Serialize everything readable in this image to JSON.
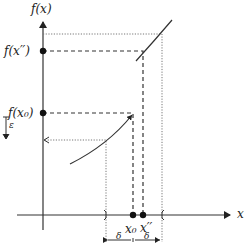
{
  "diagram": {
    "type": "epsilon-delta continuity illustration",
    "labels": {
      "y_axis": "f(x)",
      "x_axis": "x",
      "f_x_double_prime": "f(x′′)",
      "f_x0": "f(x₀)",
      "x0": "x₀",
      "x_double_prime": "x′′",
      "epsilon": "ε",
      "delta_left": "δ",
      "delta_right": "δ"
    },
    "colors": {
      "line": "#333333",
      "dotted": "#666666",
      "background": "#ffffff"
    },
    "elements": {
      "curve_lower": "lower branch of f (left of jump)",
      "curve_upper": "upper branch of f (right of jump)",
      "point_f_x0": "filled dot at f(x₀) on y-axis",
      "point_f_xpp": "filled dot at f(x′′) on y-axis",
      "point_x0": "filled dot at x₀ on x-axis",
      "point_xpp": "filled dot at x′′ on x-axis"
    }
  }
}
